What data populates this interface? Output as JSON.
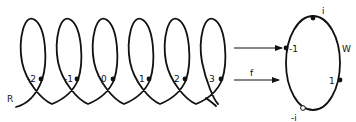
{
  "diagram": {
    "helix": {
      "label": "R",
      "points": [
        "-2",
        "-1",
        "0",
        "1",
        "2",
        "3"
      ]
    },
    "map": {
      "label": "f"
    },
    "circle": {
      "label": "W",
      "points": {
        "top": "i",
        "left": "-1",
        "right": "1",
        "bottom": "-i"
      }
    },
    "colors": {
      "stroke": "#111111",
      "background": "#ffffff"
    }
  }
}
